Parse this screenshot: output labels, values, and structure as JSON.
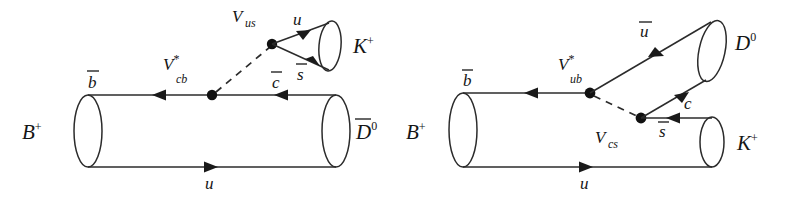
{
  "figure": {
    "background_color": "#ffffff",
    "line_color": "#2b2b2b"
  },
  "diagrams": [
    {
      "id": "left",
      "name": "b-to-c-transition",
      "description": "Color-allowed external W emission: B+ -> D0bar K+ via Vcb* and Vus",
      "initial_state": {
        "label": "B",
        "charge": "+",
        "quarks": [
          {
            "label": "b",
            "bar": true,
            "position": "top"
          },
          {
            "label": "u",
            "bar": false,
            "position": "bottom"
          }
        ]
      },
      "final_states": [
        {
          "label": "D",
          "charge": "0",
          "bar": true,
          "quarks": [
            {
              "label": "c",
              "bar": true,
              "position": "top"
            },
            {
              "label": "u",
              "bar": false,
              "position": "bottom"
            }
          ]
        },
        {
          "label": "K",
          "charge": "+",
          "bar": false,
          "quarks": [
            {
              "label": "u",
              "bar": false,
              "position": "top"
            },
            {
              "label": "s",
              "bar": true,
              "position": "bottom"
            }
          ]
        }
      ],
      "vertices": [
        {
          "name": "vertex-vcb",
          "label": "V",
          "sub": "cb",
          "star": true
        },
        {
          "name": "vertex-vus",
          "label": "V",
          "sub": "us",
          "star": false
        }
      ]
    },
    {
      "id": "right",
      "name": "b-to-u-transition",
      "description": "Color-suppressed internal W emission: B+ -> D0 K+ via Vub* and Vcs",
      "initial_state": {
        "label": "B",
        "charge": "+",
        "quarks": [
          {
            "label": "b",
            "bar": true,
            "position": "top"
          },
          {
            "label": "u",
            "bar": false,
            "position": "bottom"
          }
        ]
      },
      "final_states": [
        {
          "label": "D",
          "charge": "0",
          "bar": false,
          "quarks": [
            {
              "label": "u",
              "bar": true,
              "position": "upper"
            },
            {
              "label": "c",
              "bar": false,
              "position": "lower"
            }
          ]
        },
        {
          "label": "K",
          "charge": "+",
          "bar": false,
          "quarks": [
            {
              "label": "s",
              "bar": true,
              "position": "top"
            },
            {
              "label": "u",
              "bar": false,
              "position": "bottom"
            }
          ]
        }
      ],
      "vertices": [
        {
          "name": "vertex-vub",
          "label": "V",
          "sub": "ub",
          "star": true
        },
        {
          "name": "vertex-vcs",
          "label": "V",
          "sub": "cs",
          "star": false
        }
      ]
    }
  ],
  "labels": {
    "left": {
      "B_plus": "B",
      "B_plus_charge": "+",
      "bbar": "b",
      "u_bottom": "u",
      "Vcb": "V",
      "Vcb_sub": "cb",
      "Vcb_star": "*",
      "Vus": "V",
      "Vus_sub": "us",
      "cbar": "c",
      "u_kaon": "u",
      "sbar": "s",
      "K_plus": "K",
      "K_plus_charge": "+",
      "Dbar0": "D",
      "Dbar0_charge": "0"
    },
    "right": {
      "B_plus": "B",
      "B_plus_charge": "+",
      "bbar": "b",
      "u_bottom": "u",
      "Vub": "V",
      "Vub_sub": "ub",
      "Vub_star": "*",
      "Vcs": "V",
      "Vcs_sub": "cs",
      "ubar": "u",
      "c": "c",
      "sbar": "s",
      "D0": "D",
      "D0_charge": "0",
      "K_plus": "K",
      "K_plus_charge": "+"
    }
  }
}
